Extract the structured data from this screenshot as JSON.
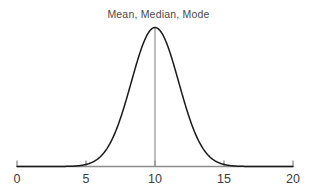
{
  "chart_data": {
    "type": "line",
    "title": "Mean, Median, Mode",
    "xlabel": "",
    "ylabel": "",
    "xlim": [
      0,
      20
    ],
    "ylim": [
      0,
      1
    ],
    "grid": false,
    "legend": null,
    "xticks": [
      0,
      5,
      10,
      15,
      20
    ],
    "xtick_labels": [
      "0",
      "5",
      "10",
      "15",
      "20"
    ],
    "yticks": [],
    "ytick_labels": [],
    "annotations": [
      {
        "name": "center-line",
        "kind": "vertical-line",
        "x": 10,
        "label": "Mean, Median, Mode",
        "color": "#999999"
      }
    ],
    "series": [
      {
        "name": "normal-distribution",
        "kind": "normal-curve",
        "mean": 10,
        "sigma": 1.72,
        "peak_value": 1,
        "color": "#1a1a1a",
        "linewidth": 1.5,
        "x": [
          0,
          1,
          2,
          2.5,
          3,
          3.5,
          4,
          4.5,
          5,
          5.5,
          6,
          6.5,
          7,
          7.5,
          8,
          8.5,
          9,
          9.5,
          10,
          10.5,
          11,
          11.5,
          12,
          12.5,
          13,
          13.5,
          14,
          14.5,
          15,
          15.5,
          16,
          17,
          18,
          19,
          20
        ],
        "values": [
          0.0,
          0.0,
          0.0,
          0.001,
          0.003,
          0.008,
          0.018,
          0.038,
          0.074,
          0.131,
          0.213,
          0.321,
          0.448,
          0.578,
          0.707,
          0.82,
          0.905,
          0.958,
          1.0,
          0.958,
          0.905,
          0.82,
          0.707,
          0.578,
          0.448,
          0.321,
          0.213,
          0.131,
          0.074,
          0.038,
          0.018,
          0.003,
          0.0,
          0.0,
          0.0
        ]
      }
    ],
    "axis": {
      "color": "#8c8c8c",
      "tick_color": "#8c8c8c",
      "label_color": "#3c3c3c"
    },
    "background": "#ffffff"
  }
}
